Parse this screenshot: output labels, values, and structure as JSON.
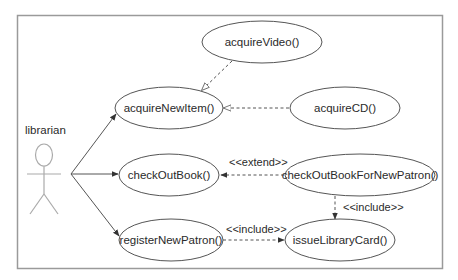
{
  "diagram": {
    "type": "UML use case diagram",
    "colors": {
      "boundary": "#9a9a9a",
      "ellipse_stroke": "#555555",
      "line": "#555555",
      "actor": "#aaaaaa",
      "text": "#2a2a2a"
    },
    "actor": {
      "name": "librarian"
    },
    "use_cases": [
      {
        "id": "acquireVideo",
        "label": "acquireVideo()"
      },
      {
        "id": "acquireNewItem",
        "label": "acquireNewItem()"
      },
      {
        "id": "acquireCD",
        "label": "acquireCD()"
      },
      {
        "id": "checkOutBook",
        "label": "checkOutBook()"
      },
      {
        "id": "checkOutBookForNewPatron",
        "label": "checkOutBookForNewPatron()"
      },
      {
        "id": "registerNewPatron",
        "label": "registerNewPatron()"
      },
      {
        "id": "issueLibraryCard",
        "label": "issueLibraryCard()"
      }
    ],
    "relationships": [
      {
        "from": "librarian",
        "to": "acquireNewItem()",
        "type": "association"
      },
      {
        "from": "librarian",
        "to": "checkOutBook()",
        "type": "association"
      },
      {
        "from": "librarian",
        "to": "registerNewPatron()",
        "type": "association"
      },
      {
        "from": "acquireVideo()",
        "to": "acquireNewItem()",
        "type": "generalization"
      },
      {
        "from": "acquireCD()",
        "to": "acquireNewItem()",
        "type": "generalization"
      },
      {
        "from": "checkOutBookForNewPatron()",
        "to": "checkOutBook()",
        "type": "extend",
        "label": "<<extend>>"
      },
      {
        "from": "checkOutBookForNewPatron()",
        "to": "issueLibraryCard()",
        "type": "include",
        "label": "<<include>>"
      },
      {
        "from": "registerNewPatron()",
        "to": "issueLibraryCard()",
        "type": "include",
        "label": "<<include>>"
      }
    ]
  }
}
